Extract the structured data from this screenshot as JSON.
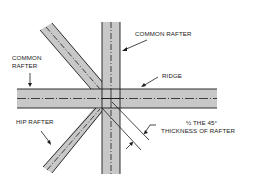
{
  "diagram": {
    "labels": {
      "common_rafter_top": "COMMON RAFTER",
      "common_rafter_left_line1": "COMMON",
      "common_rafter_left_line2": "RAFTER",
      "ridge": "RIDGE",
      "hip_rafter": "HIP RAFTER",
      "dimension_line1": "½ THE 45°",
      "dimension_line2": "THICKNESS OF RAFTER"
    },
    "members": [
      {
        "name": "ridge",
        "orientation": "horizontal"
      },
      {
        "name": "common-rafter-vertical",
        "orientation": "vertical"
      },
      {
        "name": "common-rafter-diagonal",
        "orientation": "diagonal-upper-left"
      },
      {
        "name": "hip-rafter",
        "orientation": "diagonal-lower-left"
      }
    ],
    "colors": {
      "member_fill": "#c8c8c8",
      "stroke": "#1a1a1a",
      "background": "#ffffff"
    }
  }
}
